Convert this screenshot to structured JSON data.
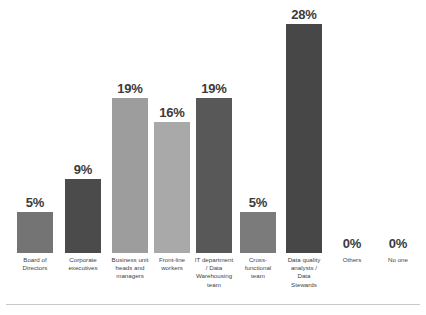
{
  "chart_data": {
    "type": "bar",
    "title": "",
    "subtitle": "",
    "xlabel": "",
    "ylabel": "",
    "ylim": [
      0,
      30
    ],
    "grid": false,
    "legend": "none",
    "orientation": "vertical",
    "value_label_suffix": "%",
    "categories": [
      "Board of Directors",
      "Corporate executives",
      "Business unit heads and managers",
      "Front-line workers",
      "IT department / Data Warehousing team",
      "Cross-functional team",
      "Data quality analysts / Data Stewards",
      "Others",
      "No one"
    ],
    "category_lines": [
      [
        "Board of",
        "Directors"
      ],
      [
        "Corporate",
        "executives"
      ],
      [
        "Business unit",
        "heads and",
        "managers"
      ],
      [
        "Front-line",
        "workers"
      ],
      [
        "IT department",
        "/ Data",
        "Warehousing",
        "team"
      ],
      [
        "Cross-",
        "functional",
        "team"
      ],
      [
        "Data quality",
        "analysts /",
        "Data",
        "Stewards"
      ],
      [
        "Others"
      ],
      [
        "No one"
      ]
    ],
    "values": [
      5,
      9,
      19,
      16,
      19,
      5,
      28,
      0,
      0
    ],
    "value_labels": [
      "5%",
      "9%",
      "19%",
      "16%",
      "19%",
      "5%",
      "28%",
      "0%",
      "0%"
    ],
    "bar_colors": [
      "#747474",
      "#4b4b4b",
      "#9d9d9d",
      "#a9a9a9",
      "#585858",
      "#7b7b7b",
      "#474747",
      "#ffffff",
      "#ffffff"
    ],
    "value_label_color": "#3b3b3b",
    "axis_label_color": "#3f3f3f",
    "background_color": "#ffffff",
    "rule_color": "#c9c9c9"
  }
}
